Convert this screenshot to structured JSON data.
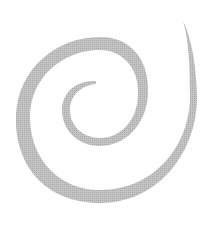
{
  "graphic": {
    "description": "Gray spiral on white background",
    "stroke_color": "#b9b9b9",
    "background_color": "#ffffff"
  }
}
